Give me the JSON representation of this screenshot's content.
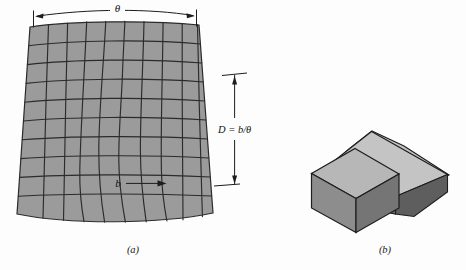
{
  "figure": {
    "background_color": "#fdfdfd",
    "ink_color": "#1d1d1d",
    "panels": [
      {
        "id": "a",
        "caption": "(a)",
        "description": "deformed-mesh-fan"
      },
      {
        "id": "b",
        "caption": "(b)",
        "description": "two-tilted-blocks"
      }
    ]
  },
  "panel_a": {
    "caption": "(a)",
    "mesh": {
      "fill_color": "#9b9b9b",
      "line_color": "#2b2b2b",
      "columns": 9,
      "rows": 10
    },
    "annotations": {
      "theta_label": "θ",
      "depth_label": "D = b/θ",
      "shear_label": "b"
    }
  },
  "panel_b": {
    "caption": "(b)",
    "blocks": [
      {
        "name": "front-block",
        "top_color": "#b5b5b5",
        "left_color": "#8f8f8f",
        "right_color": "#767676"
      },
      {
        "name": "tilted-block",
        "top_color": "#c2c2c2",
        "left_color": "#9a9a9a",
        "right_color": "#5e5e5e"
      }
    ],
    "line_color": "#1d1d1d"
  },
  "colors": {
    "mesh_fill": "#9b9b9b",
    "mesh_stroke": "#2b2b2b",
    "block_light": "#c2c2c2",
    "block_mid": "#9a9a9a",
    "block_dark": "#5e5e5e",
    "ink": "#1d1d1d",
    "paper": "#fdfdfd"
  }
}
